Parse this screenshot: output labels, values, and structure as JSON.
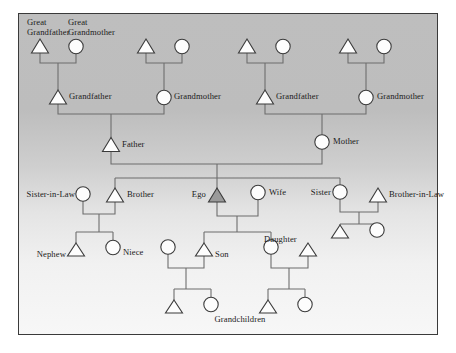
{
  "diagram": {
    "type": "kinship-chart",
    "background": {
      "top_color": "#bebebe",
      "bottom_color": "#f7f7f7",
      "border_color": "#3a3a3a"
    },
    "symbols": {
      "male": "triangle",
      "female": "circle",
      "ego_fill": "#9a9a9a",
      "node_fill": "#fdfdfd",
      "node_stroke": "#3b3b3b",
      "line_color": "#6d6d6d"
    },
    "labels": {
      "great_grandfather": "Great\nGrandfather",
      "great_grandfather_line1": "Great",
      "great_grandfather_line2": "Grandfather",
      "great_grandmother_line1": "Great",
      "great_grandmother_line2": "Grandmother",
      "grandfather_paternal": "Grandfather",
      "grandmother_paternal": "Grandmother",
      "grandfather_maternal": "Grandfather",
      "grandmother_maternal": "Grandmother",
      "father": "Father",
      "mother": "Mother",
      "sister_in_law": "Sister-in-Law",
      "brother": "Brother",
      "ego": "Ego",
      "wife": "Wife",
      "sister": "Sister",
      "brother_in_law": "Brother-in-Law",
      "nephew": "Nephew",
      "niece": "Niece",
      "son": "Son",
      "daughter": "Daughter",
      "grandchildren": "Grandchildren"
    },
    "generations": [
      {
        "name": "great-grandparents",
        "nodes": [
          {
            "id": "ggf1",
            "sex": "male",
            "label": "Great Grandfather",
            "x": 40,
            "y": 47
          },
          {
            "id": "ggm1",
            "sex": "female",
            "label": "Great Grandmother",
            "x": 76,
            "y": 47
          },
          {
            "id": "ggf2",
            "sex": "male",
            "label": "",
            "x": 146,
            "y": 47
          },
          {
            "id": "ggm2",
            "sex": "female",
            "label": "",
            "x": 182,
            "y": 47
          },
          {
            "id": "ggf3",
            "sex": "male",
            "label": "",
            "x": 247,
            "y": 47
          },
          {
            "id": "ggm3",
            "sex": "female",
            "label": "",
            "x": 283,
            "y": 47
          },
          {
            "id": "ggf4",
            "sex": "male",
            "label": "",
            "x": 348,
            "y": 47
          },
          {
            "id": "ggm4",
            "sex": "female",
            "label": "",
            "x": 384,
            "y": 47
          }
        ]
      },
      {
        "name": "grandparents",
        "nodes": [
          {
            "id": "gf1",
            "sex": "male",
            "label": "Grandfather",
            "x": 58,
            "y": 98
          },
          {
            "id": "gm1",
            "sex": "female",
            "label": "Grandmother",
            "x": 164,
            "y": 98
          },
          {
            "id": "gf2",
            "sex": "male",
            "label": "Grandfather",
            "x": 265,
            "y": 98
          },
          {
            "id": "gm2",
            "sex": "female",
            "label": "Grandmother",
            "x": 366,
            "y": 98
          }
        ]
      },
      {
        "name": "parents",
        "nodes": [
          {
            "id": "father",
            "sex": "male",
            "label": "Father",
            "x": 111,
            "y": 145
          },
          {
            "id": "mother",
            "sex": "female",
            "label": "Mother",
            "x": 322,
            "y": 142
          }
        ]
      },
      {
        "name": "ego-generation",
        "nodes": [
          {
            "id": "sisinlaw",
            "sex": "female",
            "label": "Sister-in-Law",
            "x": 83,
            "y": 195
          },
          {
            "id": "brother",
            "sex": "male",
            "label": "Brother",
            "x": 115,
            "y": 196
          },
          {
            "id": "ego",
            "sex": "male",
            "label": "Ego",
            "x": 217,
            "y": 196,
            "highlight": true
          },
          {
            "id": "wife",
            "sex": "female",
            "label": "Wife",
            "x": 258,
            "y": 193
          },
          {
            "id": "sister",
            "sex": "female",
            "label": "Sister",
            "x": 340,
            "y": 193
          },
          {
            "id": "broinlaw",
            "sex": "male",
            "label": "Brother-in-Law",
            "x": 378,
            "y": 196
          }
        ]
      },
      {
        "name": "children",
        "nodes": [
          {
            "id": "nephew",
            "sex": "male",
            "label": "Nephew",
            "x": 76,
            "y": 250
          },
          {
            "id": "niece",
            "sex": "female",
            "label": "Niece",
            "x": 113,
            "y": 247
          },
          {
            "id": "sonwife",
            "sex": "female",
            "label": "",
            "x": 168,
            "y": 247
          },
          {
            "id": "son",
            "sex": "male",
            "label": "Son",
            "x": 204,
            "y": 250
          },
          {
            "id": "daughter",
            "sex": "female",
            "label": "Daughter",
            "x": 271,
            "y": 247
          },
          {
            "id": "dauhus",
            "sex": "male",
            "label": "",
            "x": 308,
            "y": 250
          },
          {
            "id": "nephew2",
            "sex": "male",
            "label": "",
            "x": 340,
            "y": 232
          },
          {
            "id": "niece2",
            "sex": "female",
            "label": "",
            "x": 377,
            "y": 230
          }
        ]
      },
      {
        "name": "grandchildren",
        "nodes": [
          {
            "id": "gc1",
            "sex": "male",
            "label": "Grandchildren",
            "x": 174,
            "y": 307
          },
          {
            "id": "gc2",
            "sex": "female",
            "label": "",
            "x": 211,
            "y": 304
          },
          {
            "id": "gc3",
            "sex": "male",
            "label": "",
            "x": 268,
            "y": 307
          },
          {
            "id": "gc4",
            "sex": "female",
            "label": "",
            "x": 305,
            "y": 304
          }
        ]
      }
    ]
  }
}
